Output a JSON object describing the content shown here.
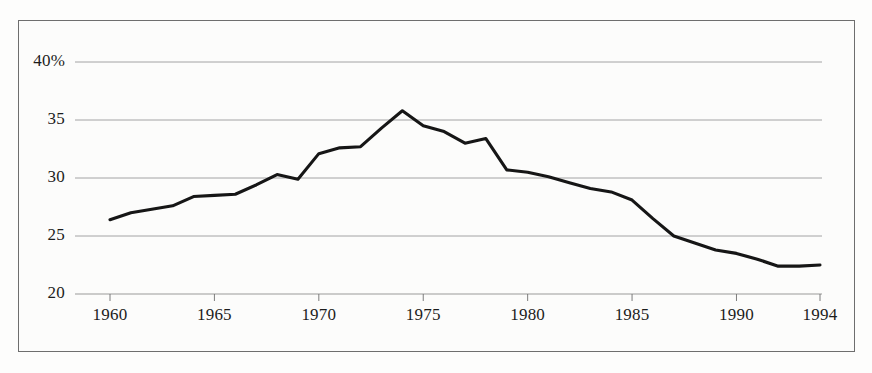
{
  "chart_data": {
    "type": "line",
    "title": "",
    "subtitle": "",
    "xlabel": "",
    "ylabel": "",
    "xlim": [
      1959,
      1994.5
    ],
    "ylim": [
      20,
      41.5
    ],
    "grid": true,
    "legend": false,
    "y_ticks": [
      {
        "value": 40,
        "label": "40%"
      },
      {
        "value": 35,
        "label": "35"
      },
      {
        "value": 30,
        "label": "30"
      },
      {
        "value": 25,
        "label": "25"
      },
      {
        "value": 20,
        "label": "20"
      }
    ],
    "x_ticks": [
      {
        "value": 1960,
        "label": "1960"
      },
      {
        "value": 1965,
        "label": "1965"
      },
      {
        "value": 1970,
        "label": "1970"
      },
      {
        "value": 1975,
        "label": "1975"
      },
      {
        "value": 1980,
        "label": "1980"
      },
      {
        "value": 1985,
        "label": "1985"
      },
      {
        "value": 1990,
        "label": "1990"
      },
      {
        "value": 1994,
        "label": "1994"
      }
    ],
    "series": [
      {
        "name": "series-1",
        "color": "#161616",
        "x": [
          1960,
          1961,
          1962,
          1963,
          1964,
          1965,
          1966,
          1967,
          1968,
          1969,
          1970,
          1971,
          1972,
          1973,
          1974,
          1975,
          1976,
          1977,
          1978,
          1979,
          1980,
          1981,
          1982,
          1983,
          1984,
          1985,
          1986,
          1987,
          1988,
          1989,
          1990,
          1991,
          1992,
          1993,
          1994
        ],
        "values": [
          26.4,
          27.0,
          27.3,
          27.6,
          28.4,
          28.5,
          28.6,
          29.4,
          30.3,
          29.9,
          32.1,
          32.6,
          32.7,
          34.3,
          35.8,
          34.5,
          34.0,
          33.0,
          33.4,
          30.7,
          30.5,
          30.1,
          29.6,
          29.1,
          28.8,
          28.1,
          26.5,
          25.0,
          24.4,
          23.8,
          23.5,
          23.0,
          22.4,
          22.4,
          22.5
        ]
      }
    ],
    "colors": {
      "line": "#161616",
      "gridline": "#9a9a9a",
      "axis": "#6e6e6e",
      "border": "#6e6e6e",
      "background": "#fcfcfb",
      "text": "#1c1c1c"
    }
  }
}
